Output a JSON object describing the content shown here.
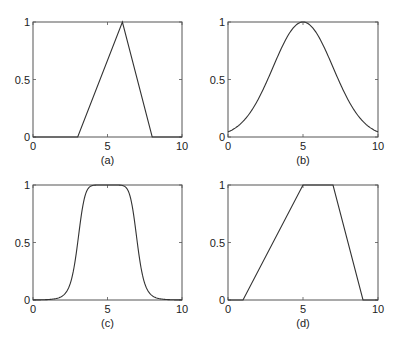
{
  "chart_data": [
    {
      "type": "line",
      "title": "",
      "caption": "(a)",
      "xlabel": "",
      "ylabel": "",
      "xlim": [
        0,
        10
      ],
      "ylim": [
        0,
        1
      ],
      "xticks": [
        "0",
        "5",
        "10"
      ],
      "yticks": [
        "0",
        "0.5",
        "1"
      ],
      "shape": "triangular",
      "x": [
        0,
        3,
        6,
        8,
        10
      ],
      "y": [
        0,
        0,
        1,
        0,
        0
      ]
    },
    {
      "type": "line",
      "title": "",
      "caption": "(b)",
      "xlabel": "",
      "ylabel": "",
      "xlim": [
        0,
        10
      ],
      "ylim": [
        0,
        1
      ],
      "xticks": [
        "0",
        "5",
        "10"
      ],
      "yticks": [
        "0",
        "0.5",
        "1"
      ],
      "shape": "gaussian",
      "params": {
        "center": 5,
        "sigma": 2
      },
      "x": [
        0,
        1,
        2,
        3,
        4,
        5,
        6,
        7,
        8,
        9,
        10
      ],
      "y": [
        0.04,
        0.14,
        0.32,
        0.61,
        0.88,
        1.0,
        0.88,
        0.61,
        0.32,
        0.14,
        0.04
      ]
    },
    {
      "type": "line",
      "title": "",
      "caption": "(c)",
      "xlabel": "",
      "ylabel": "",
      "xlim": [
        0,
        10
      ],
      "ylim": [
        0,
        1
      ],
      "xticks": [
        "0",
        "5",
        "10"
      ],
      "yticks": [
        "0",
        "0.5",
        "1"
      ],
      "shape": "generalized-bell",
      "params": {
        "a": 2,
        "b": 4,
        "c": 5
      },
      "x": [
        0,
        1,
        2,
        2.5,
        3,
        3.5,
        4,
        5,
        6,
        6.5,
        7,
        7.5,
        8,
        9,
        10
      ],
      "y": [
        0.0,
        0.02,
        0.16,
        0.33,
        0.6,
        0.86,
        0.97,
        1.0,
        0.97,
        0.86,
        0.6,
        0.33,
        0.16,
        0.02,
        0.0
      ]
    },
    {
      "type": "line",
      "title": "",
      "caption": "(d)",
      "xlabel": "",
      "ylabel": "",
      "xlim": [
        0,
        10
      ],
      "ylim": [
        0,
        1
      ],
      "xticks": [
        "0",
        "5",
        "10"
      ],
      "yticks": [
        "0",
        "0.5",
        "1"
      ],
      "shape": "trapezoidal",
      "x": [
        0,
        1,
        5,
        7,
        9,
        10
      ],
      "y": [
        0,
        0,
        1,
        1,
        0,
        0
      ]
    }
  ],
  "panels": [
    {
      "caption": "(a)",
      "box": {
        "x": 33,
        "y": 22,
        "w": 149,
        "h": 115
      }
    },
    {
      "caption": "(b)",
      "box": {
        "x": 228,
        "y": 22,
        "w": 150,
        "h": 115
      }
    },
    {
      "caption": "(c)",
      "box": {
        "x": 33,
        "y": 185,
        "w": 149,
        "h": 115
      }
    },
    {
      "caption": "(d)",
      "box": {
        "x": 228,
        "y": 185,
        "w": 150,
        "h": 115
      }
    }
  ],
  "colors": {
    "line": "#333333",
    "axis": "#555555",
    "text": "#222222"
  }
}
